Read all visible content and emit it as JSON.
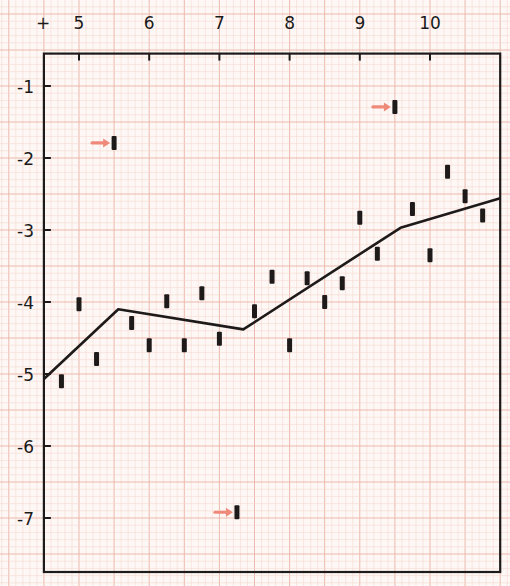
{
  "chart_data": {
    "type": "scatter",
    "title": "",
    "xlabel": "",
    "ylabel": "",
    "corner_symbol": "+",
    "xlim": [
      4.5,
      11.0
    ],
    "ylim": [
      -7.75,
      -0.55
    ],
    "x_ticks": [
      5,
      6,
      7,
      8,
      9,
      10
    ],
    "y_ticks": [
      -1,
      -2,
      -3,
      -4,
      -5,
      -6,
      -7
    ],
    "grid": "graph paper (minor 0.1, major 0.5)",
    "series": [
      {
        "name": "observations",
        "marker": "short vertical bar",
        "points": [
          {
            "x": 4.75,
            "y": -5.1
          },
          {
            "x": 5.0,
            "y": -4.03
          },
          {
            "x": 5.25,
            "y": -4.79
          },
          {
            "x": 5.75,
            "y": -4.29
          },
          {
            "x": 6.0,
            "y": -4.6
          },
          {
            "x": 6.25,
            "y": -3.99
          },
          {
            "x": 6.5,
            "y": -4.6
          },
          {
            "x": 6.75,
            "y": -3.88
          },
          {
            "x": 7.0,
            "y": -4.51
          },
          {
            "x": 7.5,
            "y": -4.13
          },
          {
            "x": 7.75,
            "y": -3.65
          },
          {
            "x": 8.0,
            "y": -4.6
          },
          {
            "x": 8.25,
            "y": -3.67
          },
          {
            "x": 8.5,
            "y": -4.0
          },
          {
            "x": 8.75,
            "y": -3.74
          },
          {
            "x": 9.0,
            "y": -2.83
          },
          {
            "x": 9.25,
            "y": -3.33
          },
          {
            "x": 9.75,
            "y": -2.71
          },
          {
            "x": 10.0,
            "y": -3.35
          },
          {
            "x": 10.25,
            "y": -2.19
          },
          {
            "x": 10.5,
            "y": -2.53
          },
          {
            "x": 10.75,
            "y": -2.8
          }
        ]
      },
      {
        "name": "outliers (arrow-marked)",
        "marker": "short vertical bar with red arrow",
        "points": [
          {
            "x": 5.5,
            "y": -1.79
          },
          {
            "x": 7.25,
            "y": -6.92
          },
          {
            "x": 9.5,
            "y": -1.29
          }
        ]
      },
      {
        "name": "piecewise linear fit",
        "type": "line",
        "points": [
          {
            "x": 4.5,
            "y": -5.07
          },
          {
            "x": 5.56,
            "y": -4.1
          },
          {
            "x": 7.34,
            "y": -4.38
          },
          {
            "x": 9.58,
            "y": -2.97
          },
          {
            "x": 11.0,
            "y": -2.56
          }
        ]
      }
    ]
  },
  "colors": {
    "paper": "#fdf8f5",
    "grid_minor": "#f4d3cc",
    "grid_major": "#eab2a6",
    "ink": "#1e1a1a",
    "arrow": "#ef8a7a"
  },
  "labels": {
    "corner": "+",
    "x": [
      "5",
      "6",
      "7",
      "8",
      "9",
      "10"
    ],
    "y": [
      "-1",
      "-2",
      "-3",
      "-4",
      "-5",
      "-6",
      "-7"
    ]
  }
}
